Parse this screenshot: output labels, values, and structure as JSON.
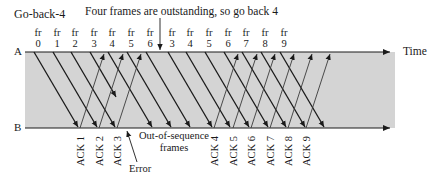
{
  "title": "Go-back-4",
  "annotation_top": "Four frames are outstanding, so go back 4",
  "station_a_label": "A",
  "station_b_label": "B",
  "time_label": "Time",
  "out_of_sequence_label": [
    "Out-of-sequence",
    "frames"
  ],
  "error_label": "Error",
  "frames_sent": [
    {
      "prefix": "fr",
      "num": "0",
      "x": 38
    },
    {
      "prefix": "fr",
      "num": "1",
      "x": 57
    },
    {
      "prefix": "fr",
      "num": "2",
      "x": 75
    },
    {
      "prefix": "fr",
      "num": "3",
      "x": 94
    },
    {
      "prefix": "fr",
      "num": "4",
      "x": 112
    },
    {
      "prefix": "fr",
      "num": "5",
      "x": 131
    },
    {
      "prefix": "fr",
      "num": "6",
      "x": 150
    },
    {
      "prefix": "fr",
      "num": "3",
      "x": 172
    },
    {
      "prefix": "fr",
      "num": "4",
      "x": 190
    },
    {
      "prefix": "fr",
      "num": "5",
      "x": 209
    },
    {
      "prefix": "fr",
      "num": "6",
      "x": 228
    },
    {
      "prefix": "fr",
      "num": "7",
      "x": 246
    },
    {
      "prefix": "fr",
      "num": "8",
      "x": 265
    },
    {
      "prefix": "fr",
      "num": "9",
      "x": 284
    }
  ],
  "acks": [
    {
      "label": "ACK 1",
      "x": 82
    },
    {
      "label": "ACK 2",
      "x": 101
    },
    {
      "label": "ACK 3",
      "x": 119
    },
    {
      "label": "ACK 4",
      "x": 216
    },
    {
      "label": "ACK 5",
      "x": 235
    },
    {
      "label": "ACK 6",
      "x": 253
    },
    {
      "label": "ACK 7",
      "x": 272
    },
    {
      "label": "ACK 8",
      "x": 290
    },
    {
      "label": "ACK 9",
      "x": 308
    }
  ],
  "colors": {
    "band": "#d4d4d4",
    "line": "#1a1a1a",
    "ack_line": "#3a3a3a"
  }
}
